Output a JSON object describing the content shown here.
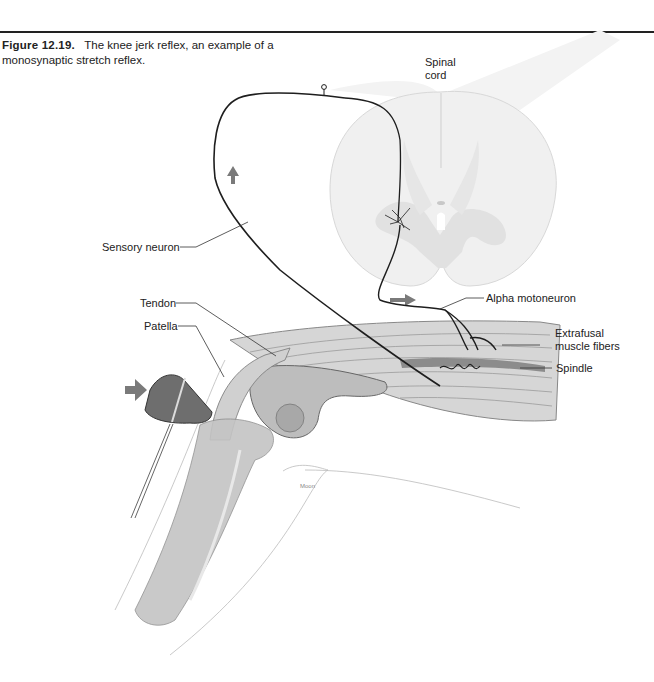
{
  "figure": {
    "number": "Figure 12.19.",
    "caption": "The knee jerk reflex, an example of a monosynaptic stretch reflex."
  },
  "labels": {
    "spinal_cord": [
      "Spinal",
      "cord"
    ],
    "sensory_neuron": "Sensory neuron",
    "tendon": "Tendon",
    "patella": "Patella",
    "alpha_motoneuron": "Alpha motoneuron",
    "extrafusal": [
      "Extrafusal",
      "muscle fibers"
    ],
    "spindle": "Spindle",
    "watermark": "Moon"
  },
  "colors": {
    "rule": "#222222",
    "neuron": "#1e1e1e",
    "arrow": "#7a7a7a",
    "cord_fill": "#f0f0f0",
    "gray_matter": "#e0e0e0"
  }
}
